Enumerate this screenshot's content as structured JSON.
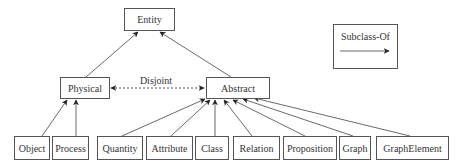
{
  "diagram": {
    "nodes": {
      "entity": "Entity",
      "physical": "Physical",
      "abstract": "Abstract",
      "object": "Object",
      "process": "Process",
      "quantity": "Quantity",
      "attribute": "Attribute",
      "class": "Class",
      "relation": "Relation",
      "proposition": "Proposition",
      "graph": "Graph",
      "graphelement": "GraphElement"
    },
    "edges": [
      {
        "from": "physical",
        "to": "entity",
        "type": "subclass-of"
      },
      {
        "from": "abstract",
        "to": "entity",
        "type": "subclass-of"
      },
      {
        "from": "object",
        "to": "physical",
        "type": "subclass-of"
      },
      {
        "from": "process",
        "to": "physical",
        "type": "subclass-of"
      },
      {
        "from": "quantity",
        "to": "abstract",
        "type": "subclass-of"
      },
      {
        "from": "attribute",
        "to": "abstract",
        "type": "subclass-of"
      },
      {
        "from": "class",
        "to": "abstract",
        "type": "subclass-of"
      },
      {
        "from": "relation",
        "to": "abstract",
        "type": "subclass-of"
      },
      {
        "from": "proposition",
        "to": "abstract",
        "type": "subclass-of"
      },
      {
        "from": "graph",
        "to": "abstract",
        "type": "subclass-of"
      },
      {
        "from": "graphelement",
        "to": "abstract",
        "type": "subclass-of"
      },
      {
        "from": "physical",
        "to": "abstract",
        "type": "disjoint"
      }
    ],
    "disjoint_label": "Disjoint",
    "legend": {
      "label": "Subclass-Of"
    }
  }
}
